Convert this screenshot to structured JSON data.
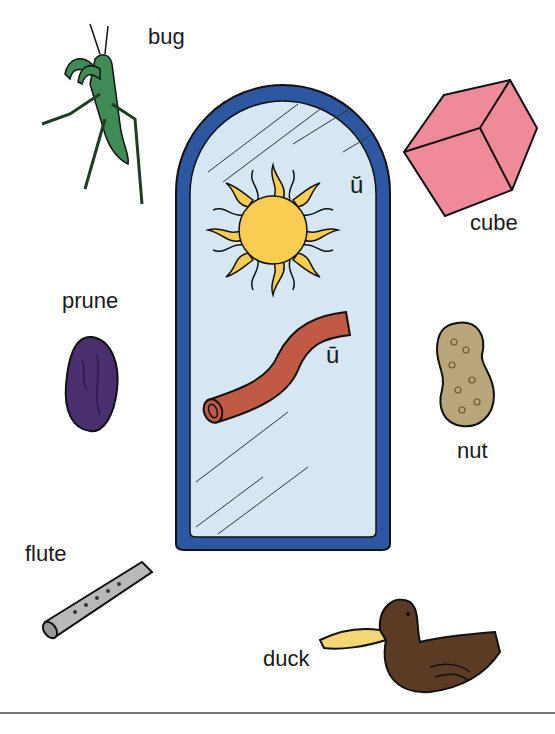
{
  "worksheet": {
    "center_panel": {
      "marks": {
        "short_u": "ŭ",
        "long_u": "ū"
      },
      "pictures": [
        "sun",
        "tube"
      ]
    },
    "items": [
      {
        "id": "bug",
        "label": "bug"
      },
      {
        "id": "cube",
        "label": "cube"
      },
      {
        "id": "prune",
        "label": "prune"
      },
      {
        "id": "nut",
        "label": "nut"
      },
      {
        "id": "flute",
        "label": "flute"
      },
      {
        "id": "duck",
        "label": "duck"
      }
    ],
    "colors": {
      "frame_blue": "#2d57a0",
      "panel_fill": "#d6e6f2",
      "sun_yellow": "#f9cd52",
      "tube_red": "#c05a45",
      "cube_pink": "#ef8a9a",
      "bug_green": "#3f8a55",
      "prune_purple": "#4a2f6e",
      "nut_tan": "#b9a57a",
      "flute_gray": "#b9b9b9",
      "duck_brown": "#5c3b24",
      "duck_bill": "#f3d774"
    }
  }
}
